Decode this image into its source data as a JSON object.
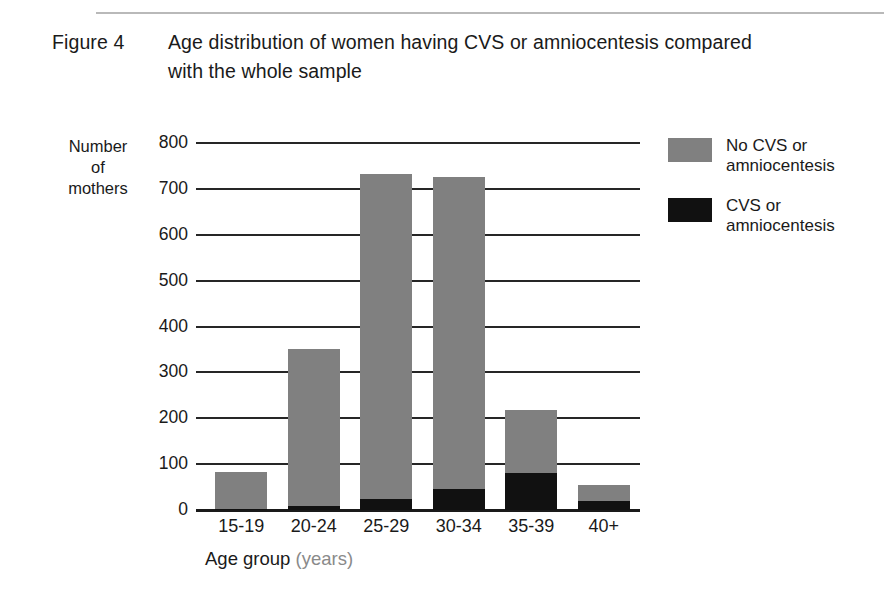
{
  "figure": {
    "label": "Figure 4",
    "title": "Age distribution of women having CVS or amniocentesis compared with the whole sample"
  },
  "axes": {
    "y_title_line1": "Number",
    "y_title_line2": "of",
    "y_title_line3": "mothers",
    "x_title": "Age group",
    "x_title_unit": "(years)",
    "y_ticks": [
      "800",
      "700",
      "600",
      "500",
      "400",
      "300",
      "200",
      "100",
      "0"
    ]
  },
  "legend": {
    "items": [
      {
        "swatch": "gray",
        "line1": "No CVS or",
        "line2": "amniocentesis",
        "color": "#808080"
      },
      {
        "swatch": "black",
        "line1": "CVS or",
        "line2": "amniocentesis",
        "color": "#111111"
      }
    ]
  },
  "chart_data": {
    "type": "bar",
    "title": "Age distribution of women having CVS or amniocentesis compared with the whole sample",
    "xlabel": "Age group (years)",
    "ylabel": "Number of mothers",
    "ylim": [
      0,
      800
    ],
    "ytick_step": 100,
    "grid": true,
    "stacked": true,
    "legend_position": "right",
    "categories": [
      "15-19",
      "20-24",
      "25-29",
      "30-34",
      "35-39",
      "40+"
    ],
    "series": [
      {
        "name": "CVS or amniocentesis",
        "color": "#111111",
        "values": [
          3,
          8,
          25,
          45,
          80,
          20
        ]
      },
      {
        "name": "No CVS or amniocentesis",
        "color": "#808080",
        "values": [
          79,
          344,
          707,
          681,
          138,
          35
        ]
      }
    ],
    "totals": [
      82,
      352,
      732,
      726,
      218,
      55
    ]
  }
}
